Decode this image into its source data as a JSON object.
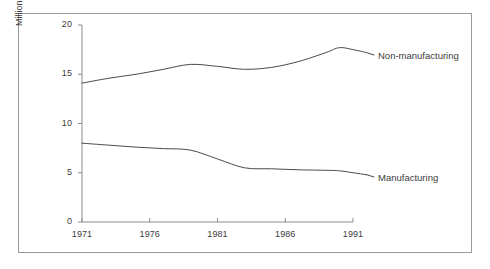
{
  "chart_data": {
    "type": "line",
    "title": "",
    "subtitle": "",
    "xlabel": "",
    "ylabel": "Millions",
    "xlim": [
      1971,
      1992
    ],
    "ylim": [
      0,
      20
    ],
    "grid": false,
    "legend_position": "inline-right",
    "x_ticks": [
      "1971",
      "1976",
      "1981",
      "1986",
      "1991"
    ],
    "x_tick_values": [
      1971,
      1976,
      1981,
      1986,
      1991
    ],
    "y_ticks": [
      "0",
      "5",
      "10",
      "15",
      "20"
    ],
    "y_tick_values": [
      0,
      5,
      10,
      15,
      20
    ],
    "series": [
      {
        "name": "Non-manufacturing",
        "color": "#4a4a4a",
        "x": [
          1971,
          1973,
          1975,
          1977,
          1979,
          1981,
          1983,
          1985,
          1987,
          1989,
          1990,
          1991,
          1992
        ],
        "values": [
          14.1,
          14.6,
          15.0,
          15.5,
          16.0,
          15.8,
          15.5,
          15.7,
          16.3,
          17.2,
          17.7,
          17.5,
          17.2
        ]
      },
      {
        "name": "Manufacturing",
        "color": "#4a4a4a",
        "x": [
          1971,
          1973,
          1975,
          1977,
          1979,
          1981,
          1983,
          1985,
          1987,
          1989,
          1990,
          1991,
          1992
        ],
        "values": [
          8.0,
          7.8,
          7.6,
          7.45,
          7.3,
          6.4,
          5.5,
          5.4,
          5.3,
          5.25,
          5.2,
          5.0,
          4.8
        ]
      }
    ],
    "annotations": [
      {
        "text": "Non-manufacturing",
        "series": "Non-manufacturing"
      },
      {
        "text": "Manufacturing",
        "series": "Manufacturing"
      }
    ]
  },
  "axis": {
    "y_title": "Millions"
  }
}
